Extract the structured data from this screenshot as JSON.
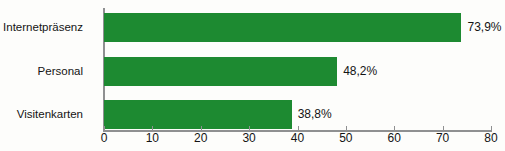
{
  "chart_data": {
    "type": "bar",
    "orientation": "horizontal",
    "title": "",
    "xlabel": "",
    "ylabel": "",
    "categories": [
      "Internetpräsenz",
      "Personal",
      "Visitenkarten"
    ],
    "values": [
      73.9,
      48.2,
      38.8
    ],
    "value_labels": [
      "73,9%",
      "48,2%",
      "38,8%"
    ],
    "xlim": [
      0,
      80
    ],
    "xticks": [
      0,
      10,
      20,
      30,
      40,
      50,
      60,
      70,
      80
    ],
    "xtick_labels": [
      "0",
      "10",
      "20",
      "30",
      "40",
      "50",
      "60",
      "70",
      "80"
    ],
    "grid": false,
    "legend": false,
    "bar_color": "#1d8a31",
    "axis_color": "#8f9091",
    "text_color": "#141414",
    "background_color": "#fdfdfb"
  }
}
